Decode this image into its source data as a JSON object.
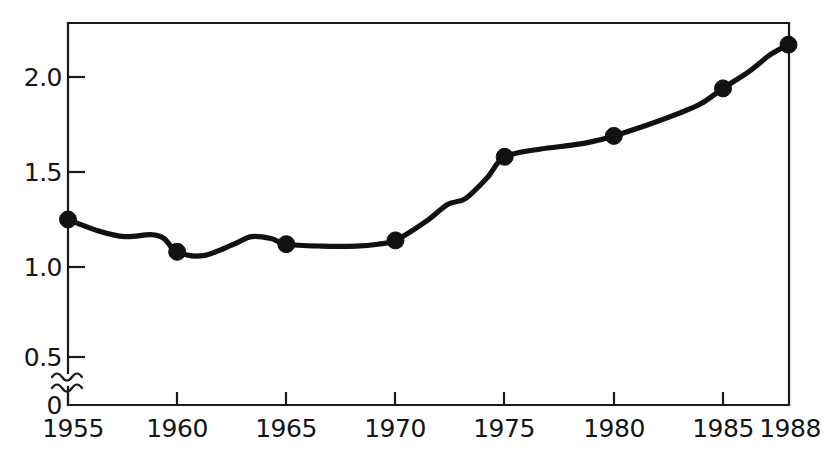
{
  "chart_data": {
    "type": "line",
    "title": "",
    "subtitle": "",
    "xlabel": "",
    "ylabel": "",
    "x": [
      1955,
      1960,
      1965,
      1970,
      1975,
      1980,
      1985,
      1988
    ],
    "values": [
      1.25,
      1.08,
      1.12,
      1.14,
      1.58,
      1.69,
      1.94,
      2.17
    ],
    "series": [
      {
        "name": "series-1",
        "x": [
          1955,
          1960,
          1965,
          1970,
          1975,
          1980,
          1985,
          1988
        ],
        "values": [
          1.25,
          1.08,
          1.12,
          1.14,
          1.58,
          1.69,
          1.94,
          2.17
        ]
      }
    ],
    "interpolated_path_points": [
      {
        "x": 1955.0,
        "y": 1.25
      },
      {
        "x": 1956.4,
        "y": 1.19
      },
      {
        "x": 1957.6,
        "y": 1.16
      },
      {
        "x": 1958.8,
        "y": 1.17
      },
      {
        "x": 1959.4,
        "y": 1.15
      },
      {
        "x": 1960.0,
        "y": 1.08
      },
      {
        "x": 1961.2,
        "y": 1.06
      },
      {
        "x": 1962.6,
        "y": 1.12
      },
      {
        "x": 1963.4,
        "y": 1.16
      },
      {
        "x": 1964.3,
        "y": 1.15
      },
      {
        "x": 1965.0,
        "y": 1.12
      },
      {
        "x": 1966.6,
        "y": 1.11
      },
      {
        "x": 1968.2,
        "y": 1.11
      },
      {
        "x": 1969.2,
        "y": 1.12
      },
      {
        "x": 1970.0,
        "y": 1.14
      },
      {
        "x": 1971.4,
        "y": 1.24
      },
      {
        "x": 1972.4,
        "y": 1.33
      },
      {
        "x": 1973.2,
        "y": 1.36
      },
      {
        "x": 1974.2,
        "y": 1.47
      },
      {
        "x": 1975.0,
        "y": 1.58
      },
      {
        "x": 1976.6,
        "y": 1.62
      },
      {
        "x": 1978.0,
        "y": 1.64
      },
      {
        "x": 1979.0,
        "y": 1.66
      },
      {
        "x": 1980.0,
        "y": 1.69
      },
      {
        "x": 1981.6,
        "y": 1.75
      },
      {
        "x": 1983.0,
        "y": 1.81
      },
      {
        "x": 1984.0,
        "y": 1.86
      },
      {
        "x": 1985.0,
        "y": 1.94
      },
      {
        "x": 1986.2,
        "y": 2.03
      },
      {
        "x": 1987.2,
        "y": 2.12
      },
      {
        "x": 1988.0,
        "y": 2.17
      }
    ],
    "xlim": [
      1955,
      1988
    ],
    "ylim": [
      0,
      2.35
    ],
    "y_axis_break": true,
    "y_break_between": [
      0,
      0.5
    ],
    "grid": false,
    "legend": null,
    "legend_position": "none",
    "marker": "filled-circle",
    "line_color": "#111111",
    "marker_color": "#111111",
    "background_color": "#ffffff",
    "axis_color": "#1a1a1a",
    "y_ticks": [
      {
        "value": 0,
        "label": "0"
      },
      {
        "value": 0.5,
        "label": "0.5"
      },
      {
        "value": 1.0,
        "label": "1.0"
      },
      {
        "value": 1.5,
        "label": "1.5"
      },
      {
        "value": 2.0,
        "label": "2.0"
      }
    ],
    "x_ticks": [
      {
        "value": 1955,
        "label": "1955"
      },
      {
        "value": 1960,
        "label": "1960"
      },
      {
        "value": 1965,
        "label": "1965"
      },
      {
        "value": 1970,
        "label": "1970"
      },
      {
        "value": 1975,
        "label": "1975"
      },
      {
        "value": 1980,
        "label": "1980"
      },
      {
        "value": 1985,
        "label": "1985"
      },
      {
        "value": 1988,
        "label": "1988"
      }
    ]
  },
  "labels": {
    "y": {
      "t0": "0",
      "t1": "0.5",
      "t2": "1.0",
      "t3": "1.5",
      "t4": "2.0"
    },
    "x": {
      "t0": "1955",
      "t1": "1960",
      "t2": "1965",
      "t3": "1970",
      "t4": "1975",
      "t5": "1980",
      "t6": "1985",
      "t7": "1988"
    }
  }
}
